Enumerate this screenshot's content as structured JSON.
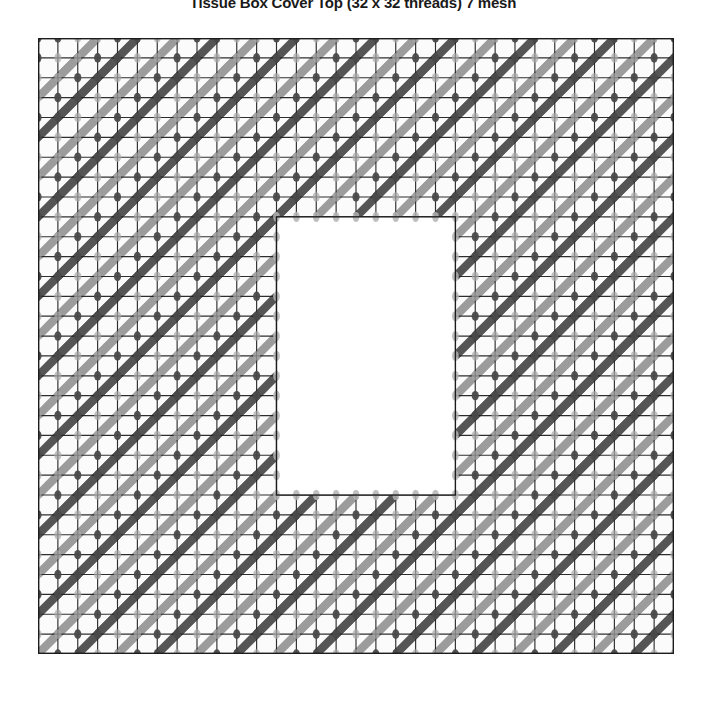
{
  "chart_data": {
    "type": "heatmap",
    "title": "Tissue Box Cover Top (32 x 32 threads) 7 mesh",
    "subtitle": "",
    "xlabel": "",
    "ylabel": "",
    "grid": true,
    "legend_position": "none",
    "mesh_count": "7 mesh",
    "threads_across": 32,
    "threads_down": 32,
    "columns": 32,
    "rows": 31,
    "cell_size_px": 19.875,
    "opening": {
      "label": "center opening",
      "col_start": 12,
      "col_end": 20,
      "row_start": 9,
      "row_end": 22,
      "width_cells": 9,
      "height_cells": 14,
      "fill": "#ffffff"
    },
    "stitch": {
      "type": "diagonal-slanted-stitch",
      "direction": "up-right",
      "span_cells": 2,
      "period_x": 2,
      "period_y": 2,
      "diagonal_offset": 1
    },
    "series": [
      {
        "name": "dark stitch",
        "color": "#555555",
        "phase": 0
      },
      {
        "name": "light stitch",
        "color": "#9c9c9c",
        "phase": 1
      }
    ],
    "colors": {
      "grid_line": "#1c1c1c",
      "canvas_bg": "#fbfbfb",
      "stitch_dark": "#555555",
      "stitch_light": "#9c9c9c",
      "knot_dark": "#4a4a4a",
      "knot_light": "#a8a8a8",
      "opening_dot": "#b4b4b4",
      "border": "#1c1c1c",
      "title_text": "#1a1a1a",
      "page_bg": "#ffffff"
    },
    "geometry": {
      "grid_left_px": 38,
      "grid_top_px": 38,
      "grid_width_px": 636,
      "grid_height_px": 616
    }
  }
}
